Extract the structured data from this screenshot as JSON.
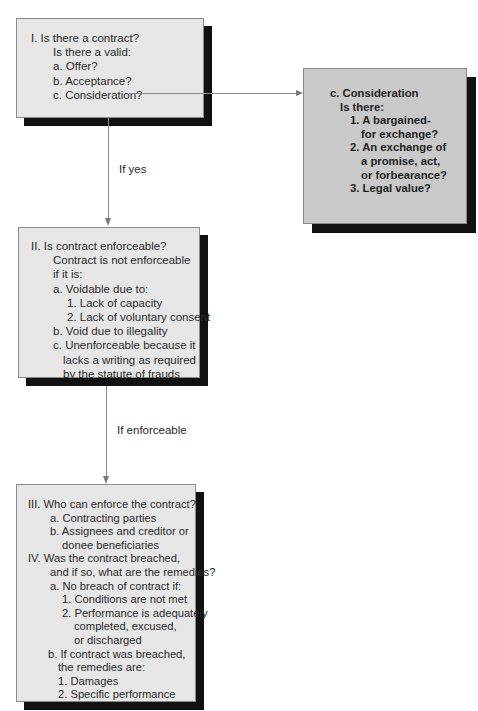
{
  "box1": {
    "lines": [
      {
        "text": "I.    Is there a contract?",
        "indent": 0
      },
      {
        "text": "Is there a valid:",
        "indent": 22
      },
      {
        "text": "a. Offer?",
        "indent": 22
      },
      {
        "text": "b. Acceptance?",
        "indent": 22
      },
      {
        "text": "c. Consideration?",
        "indent": 22
      }
    ]
  },
  "consideration_box": {
    "lines": [
      {
        "text": "c. Consideration",
        "indent": 0
      },
      {
        "text": "Is there:",
        "indent": 10
      },
      {
        "text": "1. A bargained-",
        "indent": 22
      },
      {
        "text": "for exchange?",
        "indent": 33
      },
      {
        "text": "2. An exchange of",
        "indent": 22
      },
      {
        "text": "a promise, act,",
        "indent": 33
      },
      {
        "text": "or forbearance?",
        "indent": 33
      },
      {
        "text": "3. Legal value?",
        "indent": 22
      }
    ]
  },
  "connector_labels": {
    "if_yes": "If yes",
    "if_enforceable": "If enforceable"
  },
  "box2": {
    "lines": [
      {
        "text": "II.   Is contract enforceable?",
        "indent": 0
      },
      {
        "text": "Contract is not enforceable",
        "indent": 22
      },
      {
        "text": "if it is:",
        "indent": 22
      },
      {
        "text": "a. Voidable due to:",
        "indent": 22
      },
      {
        "text": "1. Lack of capacity",
        "indent": 35
      },
      {
        "text": "2. Lack of voluntary consent",
        "indent": 35
      },
      {
        "text": "b. Void due to illegality",
        "indent": 22
      },
      {
        "text": "c. Unenforceable because it",
        "indent": 22
      },
      {
        "text": "lacks a writing as required",
        "indent": 32
      },
      {
        "text": "by the statute of frauds",
        "indent": 32
      }
    ]
  },
  "box3": {
    "lines": [
      {
        "text": "III.  Who can enforce the contract?",
        "indent": 0
      },
      {
        "text": "a. Contracting parties",
        "indent": 22
      },
      {
        "text": "b. Assignees and creditor or",
        "indent": 22
      },
      {
        "text": "donee beneficiaries",
        "indent": 34
      },
      {
        "text": "IV.  Was the contract breached,",
        "indent": 0
      },
      {
        "text": "and if so, what are the remedies?",
        "indent": 22
      },
      {
        "text": "a. No breach of contract if:",
        "indent": 22
      },
      {
        "text": "1. Conditions are not met",
        "indent": 34
      },
      {
        "text": "2. Performance is adequately",
        "indent": 34
      },
      {
        "text": "completed, excused,",
        "indent": 46
      },
      {
        "text": "or discharged",
        "indent": 46
      },
      {
        "text": "b. If contract was breached,",
        "indent": 22
      },
      {
        "text": "the remedies are:",
        "indent": 32
      },
      {
        "text": "1. Damages",
        "indent": 32
      },
      {
        "text": "2. Specific performance",
        "indent": 32
      }
    ]
  },
  "colors": {
    "box_fill": "#e6e6e6",
    "highlight_box_fill": "#c9c9c9",
    "shadow": "#111111",
    "connector": "#8d8d8d"
  }
}
